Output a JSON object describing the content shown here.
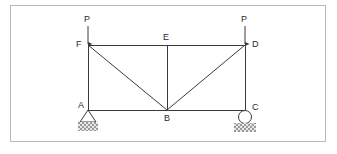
{
  "figure": {
    "type": "truss-free-body-diagram",
    "title": "",
    "border_color": "#b9b9b9",
    "line_color": "#3a3a3a",
    "hatch_color": "#9a9a9a",
    "background": "#ffffff"
  },
  "joints": [
    {
      "id": "A",
      "label": "A",
      "x": 88,
      "y": 110,
      "label_x": 78,
      "label_y": 101
    },
    {
      "id": "B",
      "label": "B",
      "x": 167,
      "y": 110,
      "label_x": 164,
      "label_y": 114
    },
    {
      "id": "C",
      "label": "C",
      "x": 245,
      "y": 110,
      "label_x": 252,
      "label_y": 103
    },
    {
      "id": "D",
      "label": "D",
      "x": 245,
      "y": 45,
      "label_x": 252,
      "label_y": 40
    },
    {
      "id": "E",
      "label": "E",
      "x": 167,
      "y": 45,
      "label_x": 163,
      "label_y": 33
    },
    {
      "id": "F",
      "label": "F",
      "x": 88,
      "y": 45,
      "label_x": 76,
      "label_y": 40
    }
  ],
  "members": [
    {
      "name": "top-chord-F-E",
      "from": "F",
      "to": "E"
    },
    {
      "name": "top-chord-E-D",
      "from": "E",
      "to": "D"
    },
    {
      "name": "bottom-chord-A-B",
      "from": "A",
      "to": "B"
    },
    {
      "name": "bottom-chord-B-C",
      "from": "B",
      "to": "C"
    },
    {
      "name": "left-vertical-F-A",
      "from": "F",
      "to": "A"
    },
    {
      "name": "right-vertical-D-C",
      "from": "D",
      "to": "C"
    },
    {
      "name": "center-vertical-E-B",
      "from": "E",
      "to": "B"
    },
    {
      "name": "diagonal-F-B",
      "from": "F",
      "to": "B"
    },
    {
      "name": "diagonal-B-D",
      "from": "B",
      "to": "D"
    }
  ],
  "loads": [
    {
      "name": "load-at-F",
      "label": "P",
      "at": "F",
      "direction": "down",
      "tail_x": 88,
      "tail_y": 26,
      "head_x": 88,
      "head_y": 45,
      "label_x": 84,
      "label_y": 15
    },
    {
      "name": "load-at-D",
      "label": "P",
      "at": "D",
      "direction": "down",
      "tail_x": 245,
      "tail_y": 26,
      "head_x": 245,
      "head_y": 45,
      "label_x": 241,
      "label_y": 15
    }
  ],
  "supports": [
    {
      "name": "pin-support-A",
      "kind": "pin",
      "at": "A",
      "x": 88,
      "y": 110
    },
    {
      "name": "roller-support-C",
      "kind": "roller",
      "at": "C",
      "x": 245,
      "y": 110
    }
  ]
}
